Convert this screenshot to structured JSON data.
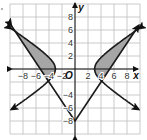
{
  "chart_data": {
    "type": "line",
    "title": "",
    "xlabel": "x",
    "ylabel": "y",
    "origin_label": "O",
    "xlim": [
      -10,
      10
    ],
    "ylim": [
      -10,
      10
    ],
    "grid": true,
    "grid_step": 2,
    "x_ticks": [
      "−8",
      "−6",
      "−4",
      "−2",
      "2",
      "4",
      "6",
      "8"
    ],
    "y_ticks": [
      "8",
      "6",
      "4",
      "2",
      "−4",
      "−6",
      "−8"
    ],
    "series": [
      {
        "name": "absolute-value V",
        "equation": "y = 1.5|x| - 8",
        "vertex": [
          0,
          -8
        ],
        "points": [
          [
            -10,
            7
          ],
          [
            -4,
            -2
          ],
          [
            0,
            -8
          ],
          [
            4,
            -2
          ],
          [
            10,
            7
          ]
        ],
        "arrows": true
      },
      {
        "name": "hyperbola left branch",
        "equation": "x^2/9 - y^2/4 = 1 (x<0)",
        "vertex": [
          -3,
          0
        ],
        "points": [
          [
            -10,
            6.36
          ],
          [
            -3,
            0
          ],
          [
            -4,
            -1.76
          ],
          [
            -10,
            -6.36
          ]
        ],
        "arrows": true
      },
      {
        "name": "hyperbola right branch",
        "equation": "x^2/9 - y^2/4 = 1 (x>0)",
        "vertex": [
          3,
          0
        ],
        "points": [
          [
            10,
            6.36
          ],
          [
            3,
            0
          ],
          [
            4,
            -1.76
          ],
          [
            10,
            -6.36
          ]
        ],
        "arrows": true
      }
    ],
    "intersections": [
      [
        -4,
        -2
      ],
      [
        4,
        -2
      ]
    ],
    "shaded_regions": [
      {
        "side": "left",
        "between": [
          "hyperbola upper-left",
          "y = 1.5|x| - 8"
        ],
        "x_range": [
          -10,
          -3
        ],
        "color": "#a6a6a6"
      },
      {
        "side": "right",
        "between": [
          "hyperbola upper-right",
          "y = 1.5|x| - 8"
        ],
        "x_range": [
          3,
          10
        ],
        "color": "#a6a6a6"
      }
    ]
  },
  "colors": {
    "grid": "#bdbdbd",
    "curve": "#1a1a1a",
    "shade": "#a6a6a6"
  }
}
